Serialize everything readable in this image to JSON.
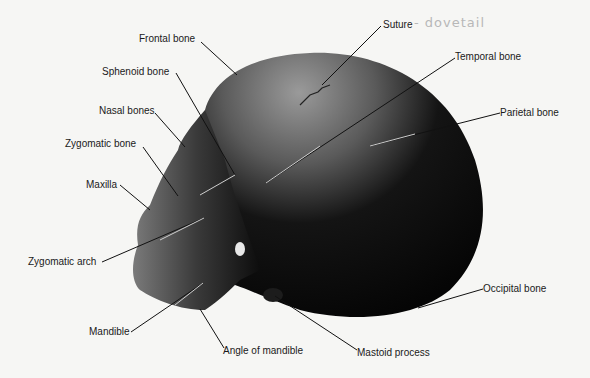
{
  "diagram": {
    "handwritten_note": "- dovetail",
    "labels": [
      {
        "id": "frontal",
        "text": "Frontal bone",
        "x": 139,
        "y": 33
      },
      {
        "id": "sphenoid",
        "text": "Sphenoid bone",
        "x": 102,
        "y": 66
      },
      {
        "id": "nasal",
        "text": "Nasal bones",
        "x": 99,
        "y": 105
      },
      {
        "id": "zygomatic-bone",
        "text": "Zygomatic bone",
        "x": 65,
        "y": 138
      },
      {
        "id": "maxilla",
        "text": "Maxilla",
        "x": 86,
        "y": 179
      },
      {
        "id": "zygomatic-arch",
        "text": "Zygomatic arch",
        "x": 28,
        "y": 256
      },
      {
        "id": "mandible",
        "text": "Mandible",
        "x": 89,
        "y": 326
      },
      {
        "id": "angle-mandible",
        "text": "Angle of mandible",
        "x": 223,
        "y": 345
      },
      {
        "id": "mastoid",
        "text": "Mastoid process",
        "x": 357,
        "y": 347
      },
      {
        "id": "occipital",
        "text": "Occipital bone",
        "x": 483,
        "y": 285
      },
      {
        "id": "parietal",
        "text": "Parietal bone",
        "x": 500,
        "y": 108
      },
      {
        "id": "temporal",
        "text": "Temporal bone",
        "x": 455,
        "y": 52
      },
      {
        "id": "suture",
        "text": "Suture",
        "x": 383,
        "y": 20
      }
    ]
  }
}
